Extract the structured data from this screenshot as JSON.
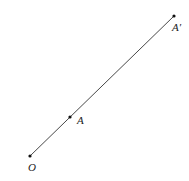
{
  "diagram": {
    "type": "geometry-dilation",
    "stroke_color": "#333333",
    "points": [
      {
        "label": "O",
        "x": 30,
        "y": 156,
        "label_x": 28,
        "label_y": 171
      },
      {
        "label": "A",
        "x": 70,
        "y": 117,
        "label_x": 77,
        "label_y": 124
      },
      {
        "label": "A′",
        "x": 174,
        "y": 16,
        "label_x": 172,
        "label_y": 31
      }
    ],
    "segment": {
      "from": "O",
      "to": "A′"
    }
  }
}
